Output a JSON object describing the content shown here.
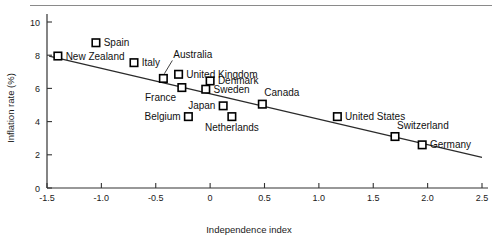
{
  "chart_data": {
    "type": "scatter",
    "title": "",
    "xlabel": "Independence index",
    "ylabel": "Inflation rate (%)",
    "xlim": [
      -1.5,
      2.5
    ],
    "ylim": [
      0,
      10
    ],
    "xticks": [
      "-1.5",
      "-1.0",
      "-0.5",
      "0",
      "0.5",
      "1.0",
      "1.5",
      "2.0",
      "2.5"
    ],
    "xtick_values": [
      -1.5,
      -1.0,
      -0.5,
      0,
      0.5,
      1.0,
      1.5,
      2.0,
      2.5
    ],
    "yticks": [
      "0",
      "2",
      "4",
      "6",
      "8",
      "10"
    ],
    "ytick_values": [
      0,
      2,
      4,
      6,
      8,
      10
    ],
    "grid": false,
    "legend": "none",
    "marker_style": "open-square",
    "points": [
      {
        "label": "Spain",
        "x": -1.05,
        "y": 8.75,
        "label_pos": "right"
      },
      {
        "label": "New Zealand",
        "x": -1.4,
        "y": 7.95,
        "label_pos": "right"
      },
      {
        "label": "Italy",
        "x": -0.7,
        "y": 7.55,
        "label_pos": "right"
      },
      {
        "label": "Australia",
        "x": -0.43,
        "y": 6.6,
        "label_pos": "leader-up"
      },
      {
        "label": "United Kingdom",
        "x": -0.29,
        "y": 6.85,
        "label_pos": "right"
      },
      {
        "label": "France",
        "x": -0.26,
        "y": 6.05,
        "label_pos": "below-left"
      },
      {
        "label": "Denmark",
        "x": 0.0,
        "y": 6.45,
        "label_pos": "right"
      },
      {
        "label": "Sweden",
        "x": -0.04,
        "y": 5.95,
        "label_pos": "right"
      },
      {
        "label": "Japan",
        "x": 0.12,
        "y": 4.95,
        "label_pos": "left"
      },
      {
        "label": "Belgium",
        "x": -0.2,
        "y": 4.3,
        "label_pos": "left"
      },
      {
        "label": "Netherlands",
        "x": 0.2,
        "y": 4.3,
        "label_pos": "below"
      },
      {
        "label": "Canada",
        "x": 0.48,
        "y": 5.05,
        "label_pos": "above-right"
      },
      {
        "label": "United States",
        "x": 1.17,
        "y": 4.3,
        "label_pos": "right"
      },
      {
        "label": "Switzerland",
        "x": 1.7,
        "y": 3.1,
        "label_pos": "above-right"
      },
      {
        "label": "Germany",
        "x": 1.95,
        "y": 2.6,
        "label_pos": "right"
      }
    ],
    "trend_line": {
      "x_start": -1.48,
      "y_start": 7.95,
      "x_end": 2.5,
      "y_end": 1.85,
      "description": "downward sloping fitted regression line"
    }
  }
}
